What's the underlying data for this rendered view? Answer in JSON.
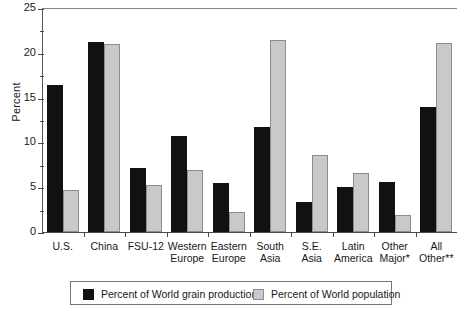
{
  "chart_data": {
    "type": "bar",
    "title": "",
    "xlabel": "",
    "ylabel": "Percent",
    "ylim": [
      0,
      25
    ],
    "yticks": [
      0,
      5,
      10,
      15,
      20,
      25
    ],
    "ytick_labels": [
      "0",
      "5",
      "10",
      "15",
      "20",
      "25"
    ],
    "yminor_step": 2.5,
    "grid": false,
    "legend_position": "bottom",
    "categories": [
      "U.S.",
      "China",
      "FSU-12",
      "Western Europe",
      "Eastern Europe",
      "South Asia",
      "S.E. Asia",
      "Latin America",
      "Other Major*",
      "All Other**"
    ],
    "category_lines": [
      [
        "U.S."
      ],
      [
        "China"
      ],
      [
        "FSU-12"
      ],
      [
        "Western",
        "Europe"
      ],
      [
        "Eastern",
        "Europe"
      ],
      [
        "South",
        "Asia"
      ],
      [
        "S.E.",
        "Asia"
      ],
      [
        "Latin",
        "America"
      ],
      [
        "Other",
        "Major*"
      ],
      [
        "All",
        "Other**"
      ]
    ],
    "series": [
      {
        "name": "Percent of World grain production",
        "color": "#111111",
        "values": [
          16.4,
          21.2,
          7.1,
          10.7,
          5.5,
          11.7,
          3.4,
          5.0,
          5.6,
          13.9
        ]
      },
      {
        "name": "Percent of World population",
        "color": "#c9c9c9",
        "values": [
          4.7,
          21.0,
          5.2,
          6.9,
          2.2,
          21.4,
          8.6,
          6.6,
          1.9,
          21.1
        ]
      }
    ]
  },
  "legend": {
    "entries": [
      {
        "label": "Percent of World grain production",
        "swatch": "prod"
      },
      {
        "label": "Percent of World population",
        "swatch": "pop"
      }
    ]
  }
}
